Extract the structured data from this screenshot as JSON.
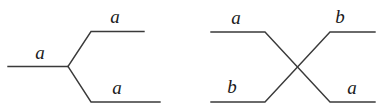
{
  "figure": {
    "background_color": "#ffffff",
    "line_color": "#3a3a3a",
    "label_color": "#1a1a1a",
    "width": 384,
    "height": 108,
    "diagrams": [
      {
        "name": "splitting-vertex-diagram",
        "type": "trivalent-vertex",
        "description": "single incoming strand splitting into two outgoing strands",
        "labels": [
          {
            "name": "incoming-left",
            "text": "a",
            "x": 40,
            "y": 52
          },
          {
            "name": "outgoing-top",
            "text": "a",
            "x": 115,
            "y": 16
          },
          {
            "name": "outgoing-bottom",
            "text": "a",
            "x": 117,
            "y": 87
          }
        ]
      },
      {
        "name": "crossing-diagram",
        "type": "braid-crossing",
        "description": "two strands crossing and exchanging labels",
        "labels": [
          {
            "name": "incoming-top-left",
            "text": "a",
            "x": 236,
            "y": 17
          },
          {
            "name": "outgoing-top-right",
            "text": "b",
            "x": 340,
            "y": 16
          },
          {
            "name": "incoming-bottom-left",
            "text": "b",
            "x": 232,
            "y": 86
          },
          {
            "name": "outgoing-bottom-right",
            "text": "a",
            "x": 352,
            "y": 87
          }
        ]
      }
    ]
  }
}
